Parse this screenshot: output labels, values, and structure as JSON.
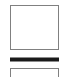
{
  "canvas": {
    "width": 79,
    "height": 77,
    "background_color": "#ffffff"
  },
  "shapes": [
    {
      "id": "upper-square",
      "kind": "rectangle-outline",
      "label": "",
      "x": 10,
      "y": 5,
      "width": 49,
      "height": 45,
      "border_color": "#808080",
      "border_width": 1,
      "fill_color": "#ffffff"
    },
    {
      "id": "divider-bar",
      "kind": "filled-bar",
      "label": "",
      "x": 10,
      "y": 57,
      "width": 49,
      "height": 5,
      "border_color": "#8c8c8c",
      "border_width": 1,
      "fill_color": "#1a1a1a"
    },
    {
      "id": "lower-rectangle",
      "kind": "rectangle-outline-clipped",
      "label": "",
      "x": 10,
      "y": 68,
      "width": 49,
      "height": 16,
      "border_color": "#808080",
      "border_width": 1,
      "fill_color": "#ffffff"
    }
  ]
}
